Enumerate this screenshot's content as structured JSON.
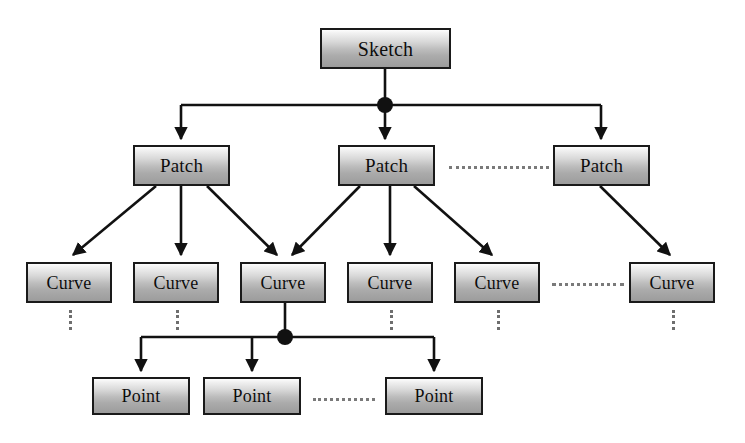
{
  "figure": {
    "background_color": "#ffffff",
    "line_color": "#111111",
    "node_fill_top": "#fdfdfd",
    "node_fill_bottom": "#9c9c9c",
    "node_border_color": "#1a1a1a",
    "ellipsis_color": "#7a7a7a"
  },
  "levels": [
    {
      "name": "sketch-level",
      "nodes": [
        {
          "id": "sketch",
          "label": "Sketch",
          "x": 320,
          "y": 28,
          "w": 131,
          "h": 41
        }
      ]
    },
    {
      "name": "patch-level",
      "nodes": [
        {
          "id": "patch-1",
          "label": "Patch",
          "x": 133,
          "y": 145,
          "w": 97,
          "h": 41
        },
        {
          "id": "patch-2",
          "label": "Patch",
          "x": 338,
          "y": 145,
          "w": 97,
          "h": 41
        },
        {
          "id": "patch-3",
          "label": "Patch",
          "x": 553,
          "y": 145,
          "w": 97,
          "h": 41
        }
      ]
    },
    {
      "name": "curve-level",
      "nodes": [
        {
          "id": "curve-1",
          "label": "Curve",
          "x": 26,
          "y": 262,
          "w": 86,
          "h": 41
        },
        {
          "id": "curve-2",
          "label": "Curve",
          "x": 133,
          "y": 262,
          "w": 86,
          "h": 41
        },
        {
          "id": "curve-3",
          "label": "Curve",
          "x": 240,
          "y": 262,
          "w": 86,
          "h": 41
        },
        {
          "id": "curve-4",
          "label": "Curve",
          "x": 347,
          "y": 262,
          "w": 86,
          "h": 41
        },
        {
          "id": "curve-5",
          "label": "Curve",
          "x": 454,
          "y": 262,
          "w": 86,
          "h": 41
        },
        {
          "id": "curve-6",
          "label": "Curve",
          "x": 629,
          "y": 262,
          "w": 86,
          "h": 41
        }
      ]
    },
    {
      "name": "point-level",
      "nodes": [
        {
          "id": "point-1",
          "label": "Point",
          "x": 92,
          "y": 377,
          "w": 98,
          "h": 38
        },
        {
          "id": "point-2",
          "label": "Point",
          "x": 203,
          "y": 377,
          "w": 98,
          "h": 38
        },
        {
          "id": "point-3",
          "label": "Point",
          "x": 385,
          "y": 377,
          "w": 98,
          "h": 38
        }
      ]
    }
  ],
  "junction_dots": [
    {
      "id": "sketch-junction",
      "cx": 385,
      "cy": 105,
      "r": 8
    },
    {
      "id": "curve-junction",
      "cx": 285,
      "cy": 337,
      "r": 8
    }
  ],
  "ellipses": [
    {
      "id": "patch-ellipsis",
      "orientation": "horizontal",
      "x": 449,
      "y": 166,
      "length": 100
    },
    {
      "id": "curve-ellipsis",
      "orientation": "horizontal",
      "x": 552,
      "y": 283,
      "length": 72
    },
    {
      "id": "point-ellipsis",
      "orientation": "horizontal",
      "x": 313,
      "y": 398,
      "length": 62
    },
    {
      "id": "curve1-ellipsis-down",
      "orientation": "vertical",
      "x": 69,
      "y": 310,
      "length": 20
    },
    {
      "id": "curve2-ellipsis-down",
      "orientation": "vertical",
      "x": 176,
      "y": 310,
      "length": 20
    },
    {
      "id": "curve4-ellipsis-down",
      "orientation": "vertical",
      "x": 390,
      "y": 310,
      "length": 20
    },
    {
      "id": "curve5-ellipsis-down",
      "orientation": "vertical",
      "x": 497,
      "y": 310,
      "length": 20
    },
    {
      "id": "curve6-ellipsis-down",
      "orientation": "vertical",
      "x": 672,
      "y": 310,
      "length": 20
    }
  ],
  "edges": [
    {
      "id": "sketch-to-bus",
      "from": "sketch",
      "to": "sketch-junction",
      "kind": "stem"
    },
    {
      "id": "bus-to-patch-1",
      "from": "sketch-junction",
      "to": "patch-1",
      "kind": "orthogonal-arrow"
    },
    {
      "id": "bus-to-patch-2",
      "from": "sketch-junction",
      "to": "patch-2",
      "kind": "orthogonal-arrow"
    },
    {
      "id": "bus-to-patch-3",
      "from": "sketch-junction",
      "to": "patch-3",
      "kind": "orthogonal-arrow"
    },
    {
      "id": "patch1-to-curve1",
      "from": "patch-1",
      "to": "curve-1",
      "kind": "diagonal-arrow"
    },
    {
      "id": "patch1-to-curve2",
      "from": "patch-1",
      "to": "curve-2",
      "kind": "straight-arrow"
    },
    {
      "id": "patch1-to-curve3",
      "from": "patch-1",
      "to": "curve-3",
      "kind": "diagonal-arrow"
    },
    {
      "id": "patch2-to-curve3",
      "from": "patch-2",
      "to": "curve-3",
      "kind": "diagonal-arrow"
    },
    {
      "id": "patch2-to-curve4",
      "from": "patch-2",
      "to": "curve-4",
      "kind": "straight-arrow"
    },
    {
      "id": "patch2-to-curve5",
      "from": "patch-2",
      "to": "curve-5",
      "kind": "diagonal-arrow"
    },
    {
      "id": "patch3-to-curve6",
      "from": "patch-3",
      "to": "curve-6",
      "kind": "diagonal-arrow"
    },
    {
      "id": "curve3-to-bus",
      "from": "curve-3",
      "to": "curve-junction",
      "kind": "stem"
    },
    {
      "id": "bus-to-point-1",
      "from": "curve-junction",
      "to": "point-1",
      "kind": "orthogonal-arrow"
    },
    {
      "id": "bus-to-point-2",
      "from": "curve-junction",
      "to": "point-2",
      "kind": "orthogonal-arrow"
    },
    {
      "id": "bus-to-point-3",
      "from": "curve-junction",
      "to": "point-3",
      "kind": "orthogonal-arrow"
    }
  ]
}
